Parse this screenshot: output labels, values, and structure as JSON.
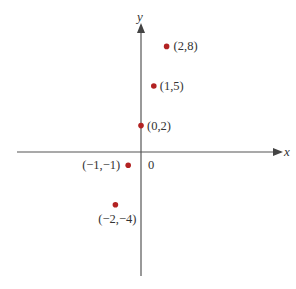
{
  "chart_data": {
    "type": "scatter",
    "title": "",
    "xlabel": "x",
    "ylabel": "y",
    "origin_label": "0",
    "points": [
      {
        "x": 2,
        "y": 8,
        "label": "(2,8)"
      },
      {
        "x": 1,
        "y": 5,
        "label": "(1,5)"
      },
      {
        "x": 0,
        "y": 2,
        "label": "(0,2)"
      },
      {
        "x": -1,
        "y": -1,
        "label": "(−1,−1)"
      },
      {
        "x": -2,
        "y": -4,
        "label": "(−2,−4)"
      }
    ],
    "xlim": [
      -10,
      12
    ],
    "ylim": [
      -9,
      10
    ],
    "grid": false,
    "legend": null,
    "colors": {
      "point": "#b22222",
      "axis": "#555555",
      "text": "#333333"
    }
  }
}
